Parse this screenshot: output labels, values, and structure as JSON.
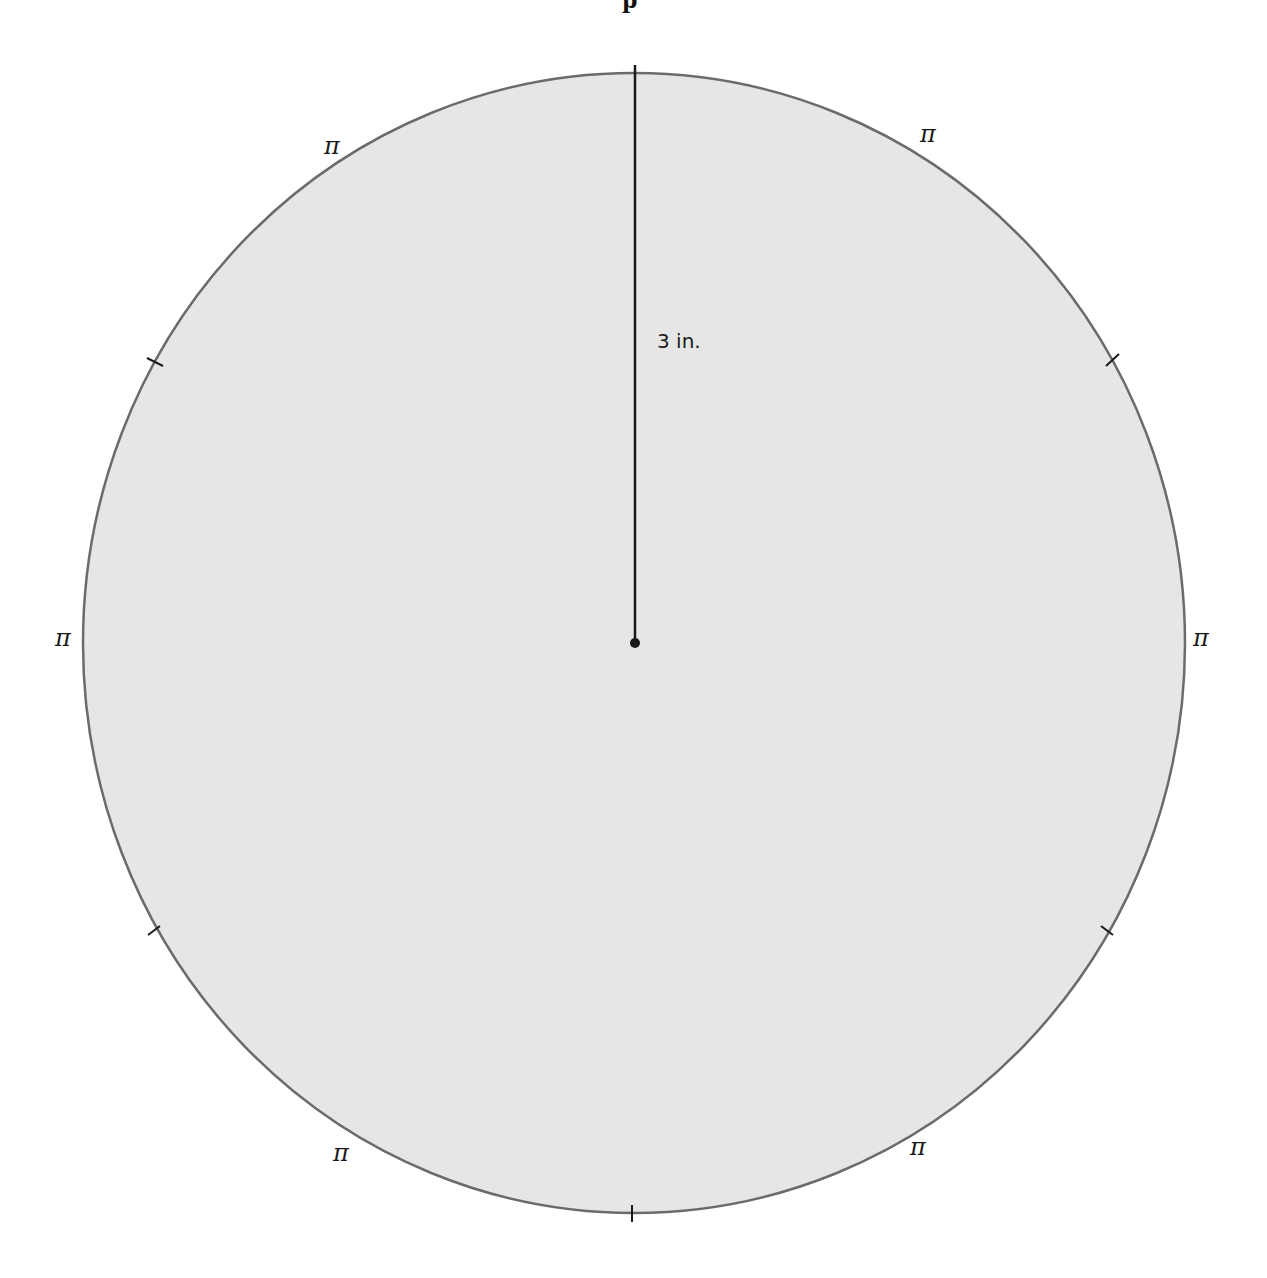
{
  "title_fragment": "p",
  "diagram": {
    "shape": "circle",
    "fill_color": "#e6e6e6",
    "stroke_color": "#6b6b6b",
    "center": [
      634,
      643
    ],
    "radius_x": 551,
    "radius_y": 570,
    "radius_label": "3 in.",
    "radius_line_color": "#1a1a1a",
    "tick_marks": 8,
    "divisions": 8,
    "arc_labels": [
      {
        "position": "upper-left",
        "text": "π"
      },
      {
        "position": "upper-right",
        "text": "π"
      },
      {
        "position": "left",
        "text": "π"
      },
      {
        "position": "right",
        "text": "π"
      },
      {
        "position": "lower-left",
        "text": "π"
      },
      {
        "position": "lower-right",
        "text": "π"
      }
    ]
  }
}
